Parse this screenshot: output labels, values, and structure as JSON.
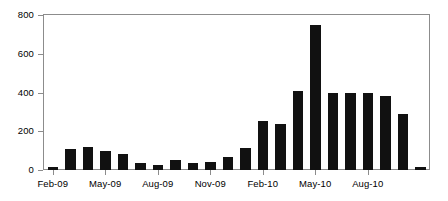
{
  "chart_data": {
    "type": "bar",
    "title": "",
    "subtitle": "",
    "xlabel": "",
    "ylabel": "",
    "ylim": [
      0,
      800
    ],
    "grid": false,
    "legend": "none",
    "bar_color": "#111111",
    "axis_color": "#8c8c8c",
    "y_ticks": [
      0,
      200,
      400,
      600,
      800
    ],
    "y_tick_labels": [
      "0",
      "200",
      "400",
      "600",
      "800"
    ],
    "x_tick_labels": [
      "Feb-09",
      "May-09",
      "Aug-09",
      "Nov-09",
      "Feb-10",
      "May-10",
      "Aug-10"
    ],
    "x_tick_categories": [
      "Feb-09",
      "May-09",
      "Aug-09",
      "Nov-09",
      "Feb-10",
      "May-10",
      "Aug-10"
    ],
    "categories": [
      "Feb-09",
      "Mar-09",
      "Apr-09",
      "May-09",
      "Jun-09",
      "Jul-09",
      "Aug-09",
      "Sep-09",
      "Oct-09",
      "Nov-09",
      "Dec-09",
      "Jan-10",
      "Feb-10",
      "Mar-10",
      "Apr-10",
      "May-10",
      "Jun-10",
      "Jul-10",
      "Aug-10",
      "Sep-10",
      "Oct-10",
      "Nov-10"
    ],
    "values": [
      15,
      110,
      118,
      98,
      85,
      35,
      25,
      50,
      35,
      40,
      65,
      115,
      255,
      240,
      410,
      750,
      400,
      400,
      400,
      380,
      290,
      15
    ]
  }
}
